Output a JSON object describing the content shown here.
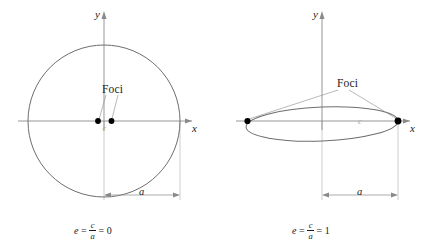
{
  "figure": {
    "panels": [
      {
        "id": "circle",
        "axis_x_label": "x",
        "axis_y_label": "y",
        "foci_label": "Foci",
        "center_label": "c",
        "dimension_label": "a",
        "equation": {
          "lhs": "e",
          "equals1": "=",
          "numerator": "c",
          "denominator": "a",
          "equals2": "=",
          "value": "0"
        },
        "shape": "circle",
        "foci_count": 2
      },
      {
        "id": "degenerate-ellipse",
        "axis_x_label": "x",
        "axis_y_label": "y",
        "foci_label": "Foci",
        "center_label": "c",
        "dimension_label": "a",
        "equation": {
          "lhs": "e",
          "equals1": "=",
          "numerator": "c",
          "denominator": "a",
          "equals2": "=",
          "value": "1"
        },
        "shape": "flat-ellipse",
        "foci_count": 2
      }
    ],
    "colors": {
      "curve": "#6e6e6e",
      "axis": "#808080",
      "focus_dot": "#000000",
      "leader_line": "#9a9a9a",
      "dimension_line": "#8a8a8a",
      "extension_line": "#b4b4b4",
      "c_label": "#a8a8a8",
      "text": "#1a1a1a",
      "background": "#ffffff"
    }
  }
}
